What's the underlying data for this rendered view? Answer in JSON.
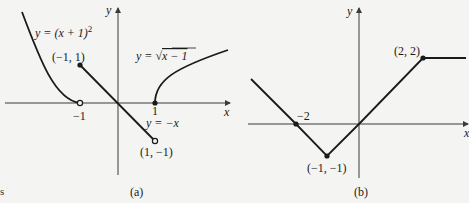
{
  "stray_text": "s",
  "panel_a": {
    "caption": "(a)",
    "axis_x": "x",
    "axis_y": "y",
    "tick_neg1": "−1",
    "tick_1": "1",
    "curve_left_label_prefix": "y = (x + 1)",
    "curve_left_label_exp": "2",
    "curve_right_label_prefix": "y = ",
    "curve_right_label_rad": "x − 1",
    "line_label": "y = −x",
    "point_top": "(−1, 1)",
    "point_bottom": "(1, −1)"
  },
  "panel_b": {
    "caption": "(b)",
    "axis_x": "x",
    "axis_y": "y",
    "tick_neg2": "−2",
    "point_min": "(−1, −1)",
    "point_corner": "(2, 2)"
  },
  "colors": {
    "ink": "#1a1a1a",
    "axis": "#3a3a3a",
    "paper": "#f4f4f2"
  }
}
